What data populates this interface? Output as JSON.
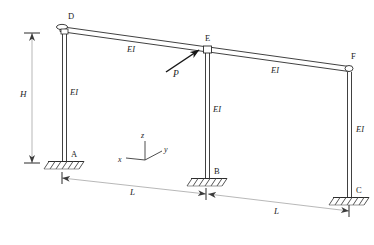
{
  "figure": {
    "type": "structural-frame-diagram",
    "stroke_color": "#2b2b2b",
    "dimension_color": "#8c8c8c",
    "hatch_color": "#6e6e6e"
  },
  "joints": [
    {
      "id": "D",
      "label": "D",
      "x": 62,
      "y": 28,
      "label_x": 68,
      "label_y": 12,
      "type": "pin-cap"
    },
    {
      "id": "E",
      "label": "E",
      "x": 205,
      "y": 48,
      "label_x": 205,
      "label_y": 34,
      "type": "pin-cap"
    },
    {
      "id": "F",
      "label": "F",
      "x": 348,
      "y": 68,
      "label_x": 351,
      "label_y": 52,
      "type": "pin-cap"
    },
    {
      "id": "A",
      "label": "A",
      "x": 65,
      "y": 160,
      "label_x": 71,
      "label_y": 150,
      "type": "fixed-support"
    },
    {
      "id": "B",
      "label": "B",
      "x": 208,
      "y": 177,
      "label_x": 214,
      "label_y": 167,
      "type": "fixed-support"
    },
    {
      "id": "C",
      "label": "C",
      "x": 350,
      "y": 196,
      "label_x": 356,
      "label_y": 186,
      "type": "fixed-support"
    }
  ],
  "members": [
    {
      "id": "DE",
      "kind": "beam",
      "from": "D",
      "to": "E",
      "stiffness_label": "EI",
      "label_x": 127,
      "label_y": 45
    },
    {
      "id": "EF",
      "kind": "beam",
      "from": "E",
      "to": "F",
      "stiffness_label": "EI",
      "label_x": 271,
      "label_y": 66
    },
    {
      "id": "AD",
      "kind": "column",
      "from": "A",
      "to": "D",
      "stiffness_label": "EI",
      "label_x": 70,
      "label_y": 88
    },
    {
      "id": "BE",
      "kind": "column",
      "from": "B",
      "to": "E",
      "stiffness_label": "EI",
      "label_x": 213,
      "label_y": 105
    },
    {
      "id": "CF",
      "kind": "column",
      "from": "C",
      "to": "F",
      "stiffness_label": "EI",
      "label_x": 356,
      "label_y": 125
    }
  ],
  "load": {
    "symbol": "P",
    "label_x": 173,
    "label_y": 70,
    "applied_at": "E",
    "tail_x": 166,
    "tail_y": 72,
    "head_x": 199,
    "head_y": 50
  },
  "dimensions": [
    {
      "id": "height",
      "label": "H",
      "label_x": 20,
      "label_y": 90,
      "orientation": "vertical",
      "x1": 32,
      "y1": 33,
      "x2": 32,
      "y2": 163
    },
    {
      "id": "span-left",
      "label": "L",
      "label_x": 130,
      "label_y": 188,
      "orientation": "oblique",
      "x1": 62,
      "y1": 178,
      "x2": 206,
      "y2": 194
    },
    {
      "id": "span-right",
      "label": "L",
      "label_x": 274,
      "label_y": 207,
      "orientation": "oblique",
      "x1": 206,
      "y1": 194,
      "x2": 349,
      "y2": 211
    }
  ],
  "axes": {
    "origin_x": 145,
    "origin_y": 160,
    "items": [
      {
        "label": "x",
        "label_x": 118,
        "label_y": 156,
        "tip_x": 126,
        "tip_y": 158
      },
      {
        "label": "y",
        "label_x": 167,
        "label_y": 149,
        "tip_x": 162,
        "tip_y": 151
      },
      {
        "label": "z",
        "label_x": 141,
        "label_y": 134,
        "tip_x": 145,
        "tip_y": 141
      }
    ]
  }
}
